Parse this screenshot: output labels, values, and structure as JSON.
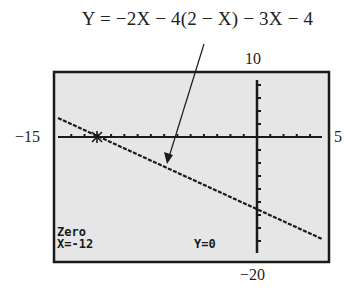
{
  "equation": {
    "text": "Y = −2X − 4(2 − X) − 3X − 4"
  },
  "window": {
    "ymax_label": "10",
    "ymin_label": "−20",
    "xmin_label": "−15",
    "xmax_label": "5"
  },
  "screen": {
    "mode_label": "Zero",
    "x_readout": "X=-12",
    "y_readout": "Y=0",
    "background": "#e6e6e6",
    "frame_color": "#1a1a1a"
  },
  "chart_data": {
    "type": "line",
    "title": "Y = −2X − 4(2 − X) − 3X − 4",
    "xlabel": "",
    "ylabel": "",
    "xlim": [
      -15,
      5
    ],
    "ylim": [
      -20,
      10
    ],
    "x_tick_step": 1,
    "y_tick_step": 2,
    "grid": false,
    "series": [
      {
        "name": "Y = -2X - 4(2 - X) - 3X - 4",
        "simplified": "Y = -X - 12",
        "x": [
          -15,
          -12,
          0,
          5
        ],
        "y": [
          3,
          0,
          -12,
          -17
        ]
      }
    ],
    "annotations": [
      {
        "type": "arrow",
        "text": "Y = −2X − 4(2 − X) − 3X − 4",
        "points_to": [
          -6.5,
          -6.5
        ]
      },
      {
        "type": "cursor",
        "text": "Zero",
        "x": -12,
        "y": 0
      }
    ],
    "legend": null
  }
}
